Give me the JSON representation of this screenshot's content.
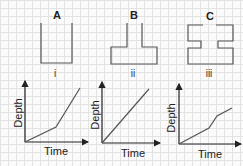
{
  "containers": [
    {
      "label": "A",
      "numeral": "i"
    },
    {
      "label": "B",
      "numeral": "ii"
    },
    {
      "label": "C",
      "numeral": "iii"
    }
  ],
  "graphs": [
    {
      "numeral": "i",
      "xlabel": "Time",
      "ylabel": "Depth"
    },
    {
      "numeral": "ii",
      "xlabel": "Time",
      "ylabel": "Depth"
    },
    {
      "numeral": "iii",
      "xlabel": "Time",
      "ylabel": "Depth"
    }
  ],
  "colors": {
    "line": "#555555",
    "axis": "#222222",
    "grid": "#e3e3e3"
  }
}
